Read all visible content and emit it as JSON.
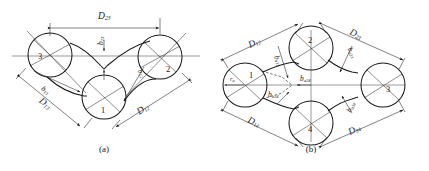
{
  "figure": {
    "captions": {
      "a": "(a)",
      "b": "(b)"
    },
    "stroke_color": "#1a1a1a",
    "background": "#ffffff"
  },
  "panel_a": {
    "caption": "(a)",
    "pulleys": [
      {
        "id": "pulley-1",
        "label": "1",
        "cx": 104,
        "cy": 97,
        "r": 22
      },
      {
        "id": "pulley-2",
        "label": "2",
        "cx": 160,
        "cy": 57,
        "r": 22
      },
      {
        "id": "pulley-3",
        "label": "3",
        "cx": 50,
        "cy": 55,
        "r": 22
      }
    ],
    "dimensions": [
      {
        "id": "dim-D23",
        "base": "D",
        "sub": "23",
        "text": "D23"
      },
      {
        "id": "dim-D13",
        "base": "D",
        "sub": "13",
        "text": "D13"
      },
      {
        "id": "dim-D12",
        "base": "D",
        "sub": "12",
        "text": "D12"
      }
    ],
    "offsets": [
      {
        "id": "off-b23",
        "base": "b",
        "sub": "23",
        "text": "b23"
      },
      {
        "id": "off-b13",
        "base": "b",
        "sub": "13",
        "text": "b13"
      },
      {
        "id": "off-b12",
        "base": "b",
        "sub": "12",
        "text": "b12"
      }
    ]
  },
  "panel_b": {
    "caption": "(b)",
    "pulleys": [
      {
        "id": "pulley-1",
        "label": "1",
        "cx": 245,
        "cy": 85,
        "r": 22
      },
      {
        "id": "pulley-2",
        "label": "2",
        "cx": 311,
        "cy": 48,
        "r": 22
      },
      {
        "id": "pulley-3",
        "label": "3",
        "cx": 383,
        "cy": 85,
        "r": 22
      },
      {
        "id": "pulley-4",
        "label": "4",
        "cx": 311,
        "cy": 123,
        "r": 22
      }
    ],
    "radius_marker": {
      "id": "radius-r",
      "base": "r",
      "sub": "a",
      "text": "ra"
    },
    "dimensions": [
      {
        "id": "dim-D12",
        "base": "D",
        "sub": "12",
        "text": "D12"
      },
      {
        "id": "dim-D23",
        "base": "D",
        "sub": "23",
        "text": "D23"
      },
      {
        "id": "dim-D14",
        "base": "D",
        "sub": "14",
        "text": "D14"
      },
      {
        "id": "dim-D34",
        "base": "D",
        "sub": "34",
        "text": "D34"
      }
    ],
    "offsets": [
      {
        "id": "off-b12",
        "base": "b",
        "sub": "a12",
        "text": "ba12"
      },
      {
        "id": "off-b23",
        "base": "b",
        "sub": "a23",
        "text": "ba23"
      },
      {
        "id": "off-b14",
        "base": "b",
        "sub": "a14",
        "text": "ba14"
      },
      {
        "id": "off-b34",
        "base": "b",
        "sub": "a34",
        "text": "ba34"
      },
      {
        "id": "off-b24",
        "base": "b",
        "sub": "a24",
        "text": "ba24"
      }
    ]
  }
}
